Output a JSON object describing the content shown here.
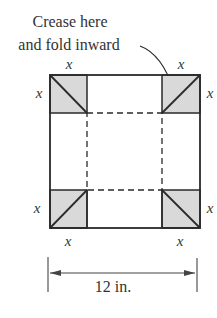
{
  "caption": {
    "line1": "Crease here",
    "line2": "and fold inward"
  },
  "labels": {
    "top_left_x": "x",
    "top_right_x": "x",
    "left_top_x": "x",
    "right_top_x": "x",
    "left_bottom_x": "x",
    "right_bottom_x": "x",
    "bottom_left_x": "x",
    "bottom_right_x": "x"
  },
  "dimension": {
    "label": "12 in."
  },
  "colors": {
    "corner_fill": "#d9d9d9",
    "stroke": "#2a2a2a"
  }
}
